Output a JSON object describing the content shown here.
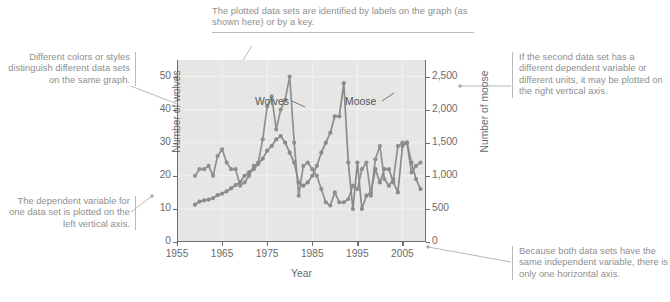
{
  "figure": {
    "kind": "annotated-textbook-graph"
  },
  "annotations": {
    "top": "The plotted data sets are identified by labels on the graph (as shown here) or by a key.",
    "left_top": "Different colors or styles distinguish different data sets on the same graph.",
    "left_bottom": "The dependent variable for one data set is plotted on the left vertical axis.",
    "right_top": "If the second data set has a different dependent variable or different units, it may be plotted on the right vertical axis.",
    "right_bottom": "Because both data sets have the same independent variable, there is only one horizontal axis."
  },
  "colors": {
    "plot_background": "#e6e6e4",
    "series_wolves": "#8f8f8f",
    "series_moose": "#8a8a8a",
    "axis": "#6d6d6d",
    "annotation_text": "#8e8e8e",
    "leader_line": "#b0b0b0"
  },
  "chart_data": {
    "type": "line",
    "title": "",
    "xlabel": "Year",
    "ylabel": "Number of wolves",
    "y2label": "Number of moose",
    "xlim": [
      1955,
      2010
    ],
    "ylim": [
      0,
      55
    ],
    "y2lim": [
      0,
      2750
    ],
    "grid": true,
    "legend": "in-plot data labels",
    "xticks": [
      "1955",
      "1965",
      "1975",
      "1985",
      "1995",
      "2005"
    ],
    "xtick_values": [
      1955,
      1965,
      1975,
      1985,
      1995,
      2005
    ],
    "yticks": [
      "0",
      "10",
      "20",
      "30",
      "40",
      "50"
    ],
    "ytick_values": [
      0,
      10,
      20,
      30,
      40,
      50
    ],
    "y2ticks": [
      "0",
      "500",
      "1,000",
      "1,500",
      "2,000",
      "2,500"
    ],
    "y2tick_values": [
      0,
      500,
      1000,
      1500,
      2000,
      2500
    ],
    "annotations_in_plot": [
      {
        "text": "Wolves",
        "x": 1969.5,
        "y": 45.5
      },
      {
        "text": "Moose",
        "x": 1982.5,
        "y": 45.5
      }
    ],
    "series": [
      {
        "name": "Wolves",
        "axis": "left",
        "units": "number of wolves",
        "x": [
          1959,
          1960,
          1961,
          1962,
          1963,
          1964,
          1965,
          1966,
          1967,
          1968,
          1969,
          1970,
          1971,
          1972,
          1973,
          1974,
          1975,
          1976,
          1977,
          1978,
          1979,
          1980,
          1981,
          1982,
          1983,
          1984,
          1985,
          1986,
          1987,
          1988,
          1989,
          1990,
          1991,
          1992,
          1993,
          1994,
          1995,
          1996,
          1997,
          1998,
          1999,
          2000,
          2001,
          2002,
          2003,
          2004,
          2005,
          2006,
          2007,
          2008,
          2009
        ],
        "values": [
          20,
          22,
          22,
          23,
          20,
          26,
          28,
          24,
          22,
          22,
          17,
          18,
          20,
          23,
          24,
          31,
          41,
          44,
          34,
          40,
          43,
          50,
          30,
          14,
          23,
          24,
          22,
          20,
          16,
          12,
          11,
          15,
          12,
          12,
          13,
          17,
          16,
          22,
          24,
          14,
          25,
          29,
          19,
          17,
          19,
          29,
          30,
          30,
          21,
          23,
          24
        ]
      },
      {
        "name": "Moose",
        "axis": "right",
        "units": "number of moose",
        "x": [
          1959,
          1960,
          1961,
          1962,
          1963,
          1964,
          1965,
          1966,
          1967,
          1968,
          1969,
          1970,
          1971,
          1972,
          1973,
          1974,
          1975,
          1976,
          1977,
          1978,
          1979,
          1980,
          1981,
          1982,
          1983,
          1984,
          1985,
          1986,
          1987,
          1988,
          1989,
          1990,
          1991,
          1992,
          1993,
          1994,
          1995,
          1996,
          1997,
          1998,
          1999,
          2000,
          2001,
          2002,
          2003,
          2004,
          2005,
          2006,
          2007,
          2008,
          2009
        ],
        "values": [
          563,
          610,
          628,
          639,
          663,
          707,
          732,
          765,
          812,
          860,
          905,
          1000,
          1055,
          1100,
          1180,
          1260,
          1380,
          1450,
          1550,
          1600,
          1500,
          1350,
          1200,
          900,
          850,
          900,
          1000,
          1150,
          1350,
          1500,
          1650,
          1900,
          1900,
          2400,
          1200,
          500,
          1200,
          500,
          700,
          750,
          1100,
          900,
          1100,
          1100,
          900,
          750,
          1450,
          1500,
          1200,
          950,
          800
        ]
      }
    ]
  }
}
